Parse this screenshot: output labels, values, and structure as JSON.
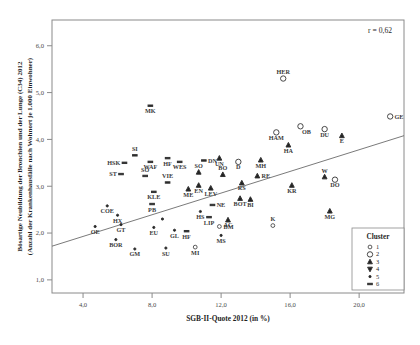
{
  "chart_data": {
    "type": "scatter",
    "title": "",
    "xlabel": "SGB-II-Quote 2012 (in %)",
    "ylabel": "Bösartige Neubildung der Bronchien und der Lunge (C34) 2012 (Anzahl der Krankenhausfälle nach Wohnort je 1.000 Einwohner)",
    "ylabel_line1": "Bösartige Neubildung der Bronchien und der Lunge (C34) 2012",
    "ylabel_line2": "(Anzahl der Krankenhausfälle nach Wohnort je 1.000 Einwohner)",
    "xlim": [
      2.2,
      22.6
    ],
    "ylim": [
      0.72,
      6.55
    ],
    "xticks": [
      4.0,
      8.0,
      12.0,
      16.0,
      20.0
    ],
    "xticklabels": [
      "4,0",
      "8,0",
      "12,0",
      "16,0",
      "20,0"
    ],
    "yticks": [
      1.0,
      2.0,
      3.0,
      4.0,
      5.0,
      6.0
    ],
    "yticklabels": [
      "1,0",
      "2,0",
      "3,0",
      "4,0",
      "5,0",
      "6,0"
    ],
    "grid": false,
    "annotation": "r = 0,62",
    "correlation": 0.62,
    "regression_line": {
      "x0": 2.2,
      "y0": 1.72,
      "x1": 22.6,
      "y1": 4.08
    },
    "legend": {
      "title": "Cluster",
      "position": "bottom-right-inside",
      "entries": [
        {
          "label": "1",
          "marker": "circle-open-small"
        },
        {
          "label": "2",
          "marker": "circle-open-large"
        },
        {
          "label": "3",
          "marker": "triangle-up-filled"
        },
        {
          "label": "4",
          "marker": "triangle-down-filled"
        },
        {
          "label": "5",
          "marker": "dot-small"
        },
        {
          "label": "6",
          "marker": "dash"
        }
      ]
    },
    "points": [
      {
        "label": "MK",
        "x": 7.9,
        "y": 4.72,
        "cluster": 6,
        "lpos": "below"
      },
      {
        "label": "HER",
        "x": 15.6,
        "y": 5.3,
        "cluster": 2,
        "lpos": "above"
      },
      {
        "label": "GE",
        "x": 21.8,
        "y": 4.49,
        "cluster": 2,
        "lpos": "right"
      },
      {
        "label": "OB",
        "x": 16.6,
        "y": 4.28,
        "cluster": 2,
        "lpos": "belowright"
      },
      {
        "label": "DU",
        "x": 18.0,
        "y": 4.22,
        "cluster": 2,
        "lpos": "below"
      },
      {
        "label": "E",
        "x": 19.0,
        "y": 4.08,
        "cluster": 3,
        "lpos": "below"
      },
      {
        "label": "HAM",
        "x": 15.2,
        "y": 4.15,
        "cluster": 2,
        "lpos": "below"
      },
      {
        "label": "HA",
        "x": 15.9,
        "y": 3.88,
        "cluster": 3,
        "lpos": "below"
      },
      {
        "label": "MH",
        "x": 14.3,
        "y": 3.56,
        "cluster": 3,
        "lpos": "below"
      },
      {
        "label": "D",
        "x": 13.0,
        "y": 3.52,
        "cluster": 2,
        "lpos": "below"
      },
      {
        "label": "UN",
        "x": 11.9,
        "y": 3.6,
        "cluster": 3,
        "lpos": "below"
      },
      {
        "label": "RE",
        "x": 14.1,
        "y": 3.22,
        "cluster": 3,
        "lpos": "right"
      },
      {
        "label": "KR",
        "x": 16.1,
        "y": 3.02,
        "cluster": 3,
        "lpos": "below"
      },
      {
        "label": "W",
        "x": 18.0,
        "y": 3.2,
        "cluster": 3,
        "lpos": "above"
      },
      {
        "label": "DO",
        "x": 18.6,
        "y": 3.14,
        "cluster": 2,
        "lpos": "below"
      },
      {
        "label": "MG",
        "x": 18.3,
        "y": 2.47,
        "cluster": 3,
        "lpos": "below"
      },
      {
        "label": "K",
        "x": 15.0,
        "y": 2.16,
        "cluster": 1,
        "lpos": "above"
      },
      {
        "label": "BI",
        "x": 13.7,
        "y": 2.72,
        "cluster": 3,
        "lpos": "below"
      },
      {
        "label": "BOT",
        "x": 13.1,
        "y": 2.74,
        "cluster": 3,
        "lpos": "below"
      },
      {
        "label": "RS",
        "x": 13.2,
        "y": 3.07,
        "cluster": 3,
        "lpos": "below"
      },
      {
        "label": "AC",
        "x": 12.4,
        "y": 2.28,
        "cluster": 3,
        "lpos": "below"
      },
      {
        "label": "LIP",
        "x": 11.3,
        "y": 2.34,
        "cluster": 6,
        "lpos": "below"
      },
      {
        "label": "HF",
        "x": 10.0,
        "y": 2.04,
        "cluster": 6,
        "lpos": "below"
      },
      {
        "label": "LEV",
        "x": 11.4,
        "y": 2.96,
        "cluster": 3,
        "lpos": "below"
      },
      {
        "label": "EN",
        "x": 10.7,
        "y": 3.02,
        "cluster": 3,
        "lpos": "below"
      },
      {
        "label": "ME",
        "x": 10.1,
        "y": 2.94,
        "cluster": 3,
        "lpos": "below"
      },
      {
        "label": "BO",
        "x": 12.1,
        "y": 3.25,
        "cluster": 3,
        "lpos": "above"
      },
      {
        "label": "SO",
        "x": 10.7,
        "y": 3.3,
        "cluster": 3,
        "lpos": "above"
      },
      {
        "label": "DN",
        "x": 11.0,
        "y": 3.55,
        "cluster": 6,
        "lpos": "right"
      },
      {
        "label": "WES",
        "x": 9.6,
        "y": 3.52,
        "cluster": 6,
        "lpos": "below"
      },
      {
        "label": "HF",
        "x": 8.9,
        "y": 3.6,
        "cluster": 6,
        "lpos": "below"
      },
      {
        "label": "WAF",
        "x": 7.9,
        "y": 3.52,
        "cluster": 6,
        "lpos": "below"
      },
      {
        "label": "SI",
        "x": 7.0,
        "y": 3.66,
        "cluster": 6,
        "lpos": "above"
      },
      {
        "label": "HSK",
        "x": 6.4,
        "y": 3.5,
        "cluster": 6,
        "lpos": "left"
      },
      {
        "label": "ST",
        "x": 6.2,
        "y": 3.26,
        "cluster": 6,
        "lpos": "left"
      },
      {
        "label": "SO",
        "x": 7.6,
        "y": 3.22,
        "cluster": 6,
        "lpos": "above"
      },
      {
        "label": "VIE",
        "x": 8.9,
        "y": 3.08,
        "cluster": 6,
        "lpos": "above"
      },
      {
        "label": "KLE",
        "x": 8.1,
        "y": 2.88,
        "cluster": 6,
        "lpos": "below"
      },
      {
        "label": "PB",
        "x": 8.0,
        "y": 2.62,
        "cluster": 6,
        "lpos": "below"
      },
      {
        "label": "COE",
        "x": 5.4,
        "y": 2.58,
        "cluster": 5,
        "lpos": "below"
      },
      {
        "label": "HX",
        "x": 6.0,
        "y": 2.38,
        "cluster": 5,
        "lpos": "below"
      },
      {
        "label": "OE",
        "x": 4.7,
        "y": 2.14,
        "cluster": 5,
        "lpos": "below"
      },
      {
        "label": "GT",
        "x": 6.2,
        "y": 2.18,
        "cluster": 5,
        "lpos": "below"
      },
      {
        "label": "EU",
        "x": 8.1,
        "y": 2.12,
        "cluster": 5,
        "lpos": "below"
      },
      {
        "label": "GL",
        "x": 9.3,
        "y": 2.06,
        "cluster": 5,
        "lpos": "below"
      },
      {
        "label": "HS",
        "x": 10.8,
        "y": 2.46,
        "cluster": 5,
        "lpos": "below"
      },
      {
        "label": "NE",
        "x": 11.5,
        "y": 2.6,
        "cluster": 6,
        "lpos": "right"
      },
      {
        "label": "BM",
        "x": 11.9,
        "y": 2.14,
        "cluster": 1,
        "lpos": "right"
      },
      {
        "label": "MS",
        "x": 12.0,
        "y": 1.95,
        "cluster": 5,
        "lpos": "below"
      },
      {
        "label": "BOR",
        "x": 5.9,
        "y": 1.86,
        "cluster": 5,
        "lpos": "below"
      },
      {
        "label": "GM",
        "x": 7.0,
        "y": 1.66,
        "cluster": 5,
        "lpos": "below"
      },
      {
        "label": "SU",
        "x": 8.8,
        "y": 1.68,
        "cluster": 5,
        "lpos": "below"
      },
      {
        "label": "MI",
        "x": 10.5,
        "y": 1.7,
        "cluster": 1,
        "lpos": "below"
      },
      {
        "label": "KLE",
        "x": 8.6,
        "y": 2.3,
        "cluster": 5,
        "lpos": "none"
      }
    ]
  }
}
